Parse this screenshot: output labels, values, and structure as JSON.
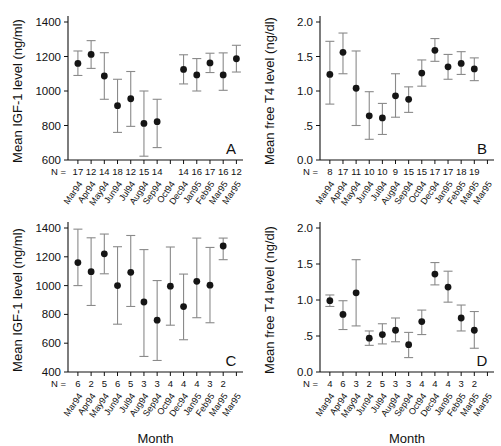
{
  "figure": {
    "xaxis_title": "Month",
    "n_prefix": "N =",
    "months": [
      "Mar94",
      "Apr94",
      "May94",
      "Jun94",
      "Jul94",
      "Aug94",
      "Sep94",
      "Oct94",
      "Dec94",
      "Jan95",
      "Feb95",
      "Mar95"
    ],
    "month_slots": [
      "Mar94",
      "Apr94",
      "May94",
      "Jun94",
      "Jul94",
      "Aug94",
      "Sep94",
      "Oct94",
      "Dec94",
      "Jan95",
      "Feb95",
      "Mar95",
      "Mar95"
    ]
  },
  "chart_data": [
    {
      "type": "scatter",
      "panel": "A",
      "title": "",
      "xlabel": "",
      "ylabel": "Mean IGF-1 level (ng/ml)",
      "ylim": [
        600,
        1400
      ],
      "yticks": [
        600,
        800,
        1000,
        1200,
        1400
      ],
      "ytick_labels": [
        "600",
        "800",
        "1000",
        "1200",
        "1400"
      ],
      "grid": false,
      "error_type": "error bars",
      "categories": [
        "Mar94",
        "Apr94",
        "May94",
        "Jun94",
        "Jul94",
        "Aug94",
        "Sep94",
        "Oct94",
        "Dec94",
        "Jan95",
        "Feb95",
        "Mar95"
      ],
      "slot_index": [
        0,
        1,
        2,
        3,
        4,
        5,
        6,
        8,
        9,
        10,
        11,
        12
      ],
      "n_values": [
        17,
        12,
        14,
        18,
        12,
        15,
        14,
        14,
        16,
        17,
        16,
        12
      ],
      "values": [
        1160,
        1212,
        1087,
        915,
        955,
        812,
        822,
        1125,
        1093,
        1163,
        1093,
        1187
      ],
      "err_low": [
        1090,
        1131,
        952,
        760,
        795,
        622,
        672,
        1041,
        1000,
        1107,
        1004,
        1110
      ],
      "err_high": [
        1232,
        1292,
        1222,
        1068,
        1113,
        1000,
        952,
        1210,
        1188,
        1219,
        1221,
        1265
      ]
    },
    {
      "type": "scatter",
      "panel": "B",
      "title": "",
      "xlabel": "",
      "ylabel": "Mean free T4 level (ng/dl)",
      "ylim": [
        0.0,
        2.0
      ],
      "yticks": [
        0.0,
        0.5,
        1.0,
        1.5,
        2.0
      ],
      "ytick_labels": [
        "0.0",
        ".5",
        "1.0",
        "1.5",
        "2.0"
      ],
      "grid": false,
      "error_type": "error bars",
      "categories": [
        "Mar94",
        "Apr94",
        "May94",
        "Jun94",
        "Jul94",
        "Aug94",
        "Sep94",
        "Oct94",
        "Dec94",
        "Jan95",
        "Feb95",
        "Mar95"
      ],
      "slot_index": [
        0,
        1,
        2,
        3,
        4,
        5,
        6,
        7,
        8,
        9,
        10,
        11
      ],
      "n_values": [
        8,
        17,
        11,
        10,
        10,
        9,
        15,
        15,
        17,
        17,
        18,
        19
      ],
      "values": [
        1.24,
        1.56,
        1.04,
        0.64,
        0.61,
        0.93,
        0.88,
        1.26,
        1.59,
        1.35,
        1.4,
        1.32
      ],
      "err_low": [
        0.81,
        1.25,
        0.5,
        0.3,
        0.37,
        0.62,
        0.69,
        1.07,
        1.43,
        1.17,
        1.24,
        1.15
      ],
      "err_high": [
        1.72,
        1.84,
        1.58,
        0.99,
        0.82,
        1.25,
        1.06,
        1.45,
        1.76,
        1.53,
        1.57,
        1.48
      ]
    },
    {
      "type": "scatter",
      "panel": "C",
      "title": "",
      "xlabel": "Month",
      "ylabel": "Mean IGF-1 level (ng/ml)",
      "ylim": [
        400,
        1400
      ],
      "yticks": [
        400,
        600,
        800,
        1000,
        1200,
        1400
      ],
      "ytick_labels": [
        "400",
        "600",
        "800",
        "1000",
        "1200",
        "1400"
      ],
      "grid": false,
      "error_type": "error bars",
      "categories": [
        "Mar94",
        "Apr94",
        "May94",
        "Jun94",
        "Jul94",
        "Aug94",
        "Sep94",
        "Oct94",
        "Dec94",
        "Jan95",
        "Feb95",
        "Mar95"
      ],
      "slot_index": [
        0,
        1,
        2,
        3,
        4,
        5,
        6,
        7,
        8,
        9,
        10,
        11
      ],
      "n_values": [
        6,
        2,
        5,
        6,
        5,
        3,
        3,
        4,
        4,
        4,
        3,
        2
      ],
      "values": [
        1160,
        1097,
        1221,
        1000,
        1092,
        886,
        760,
        996,
        854,
        1030,
        1003,
        1275
      ],
      "err_low": [
        1000,
        862,
        1082,
        732,
        855,
        508,
        480,
        725,
        624,
        777,
        742,
        1180
      ],
      "err_high": [
        1392,
        1332,
        1358,
        1270,
        1348,
        1250,
        1035,
        1268,
        1080,
        1330,
        1265,
        1330
      ]
    },
    {
      "type": "scatter",
      "panel": "D",
      "title": "",
      "xlabel": "Month",
      "ylabel": "Mean free T4 level (ng/dl)",
      "ylim": [
        0.0,
        2.0
      ],
      "yticks": [
        0.0,
        0.5,
        1.0,
        1.5,
        2.0
      ],
      "ytick_labels": [
        "0.0",
        ".5",
        "1.0",
        "1.5",
        "2.0"
      ],
      "grid": false,
      "error_type": "error bars",
      "categories": [
        "Mar94",
        "Apr94",
        "May94",
        "Jun94",
        "Jul94",
        "Aug94",
        "Sep94",
        "Oct94",
        "Dec94",
        "Jan95",
        "Feb95",
        "Mar95"
      ],
      "slot_index": [
        0,
        1,
        2,
        3,
        4,
        5,
        6,
        7,
        8,
        9,
        10,
        11
      ],
      "n_values": [
        4,
        6,
        3,
        2,
        5,
        3,
        3,
        4,
        4,
        4,
        3,
        2
      ],
      "values": [
        0.99,
        0.8,
        1.1,
        0.47,
        0.52,
        0.58,
        0.38,
        0.7,
        1.36,
        1.18,
        0.75,
        0.58
      ],
      "err_low": [
        0.91,
        0.59,
        0.64,
        0.37,
        0.39,
        0.42,
        0.2,
        0.52,
        1.21,
        0.97,
        0.57,
        0.33
      ],
      "err_high": [
        1.07,
        0.99,
        1.56,
        0.57,
        0.67,
        0.75,
        0.55,
        0.86,
        1.52,
        1.4,
        0.93,
        0.84
      ]
    }
  ]
}
